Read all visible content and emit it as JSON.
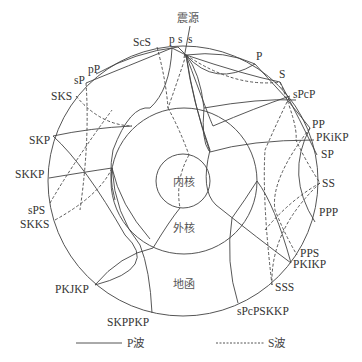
{
  "title": "震源",
  "regions": {
    "inner_core": "内核",
    "outer_core": "外核",
    "mantle": "地函"
  },
  "source_labels": {
    "p": "p",
    "s_left": "s",
    "s_right": "s"
  },
  "phases_left": [
    {
      "label": "ScS",
      "wave": "S"
    },
    {
      "label": "pP",
      "wave": "P"
    },
    {
      "label": "sP",
      "wave": "P"
    },
    {
      "label": "SKS",
      "wave": "S"
    },
    {
      "label": "SKP",
      "wave": "P"
    },
    {
      "label": "SKKP",
      "wave": "P"
    },
    {
      "label": "sPS",
      "wave": "S"
    },
    {
      "label": "SKKS",
      "wave": "S"
    },
    {
      "label": "PKJKP",
      "wave": "P"
    },
    {
      "label": "SKPPKP",
      "wave": "P"
    }
  ],
  "phases_right": [
    {
      "label": "P",
      "wave": "P"
    },
    {
      "label": "S",
      "wave": "S"
    },
    {
      "label": "sPcP",
      "wave": "P"
    },
    {
      "label": "PP",
      "wave": "P"
    },
    {
      "label": "PKiKP",
      "wave": "P"
    },
    {
      "label": "SP",
      "wave": "P"
    },
    {
      "label": "SS",
      "wave": "S"
    },
    {
      "label": "PPP",
      "wave": "P"
    },
    {
      "label": "PPS",
      "wave": "S"
    },
    {
      "label": "PKIKP",
      "wave": "P"
    },
    {
      "label": "SSS",
      "wave": "S"
    },
    {
      "label": "sPcPSKKP",
      "wave": "P"
    }
  ],
  "legend": {
    "p_wave": "P波",
    "s_wave": "S波"
  }
}
